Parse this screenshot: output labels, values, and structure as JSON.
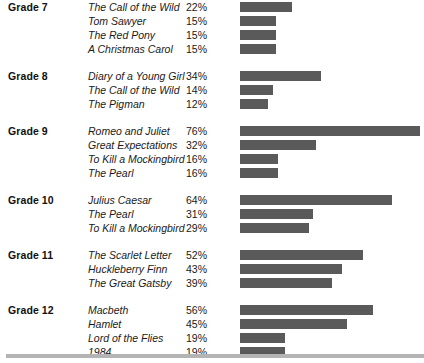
{
  "chart_data": {
    "type": "bar",
    "title": "",
    "subtitle": "",
    "xlabel": "",
    "ylabel": "",
    "xlim": [
      0,
      76
    ],
    "grid": false,
    "legend_position": "none",
    "orientation": "horizontal",
    "bar_color": "#5a5a5a",
    "value_suffix": "%",
    "groups": [
      {
        "label": "Grade 7",
        "items": [
          {
            "title": "The Call of the Wild",
            "value": 22,
            "value_label": "22%"
          },
          {
            "title": "Tom Sawyer",
            "value": 15,
            "value_label": "15%"
          },
          {
            "title": "The Red Pony",
            "value": 15,
            "value_label": "15%"
          },
          {
            "title": "A Christmas Carol",
            "value": 15,
            "value_label": "15%"
          }
        ]
      },
      {
        "label": "Grade 8",
        "items": [
          {
            "title": "Diary of a Young Girl",
            "value": 34,
            "value_label": "34%"
          },
          {
            "title": "The Call of the Wild",
            "value": 14,
            "value_label": "14%"
          },
          {
            "title": "The Pigman",
            "value": 12,
            "value_label": "12%"
          }
        ]
      },
      {
        "label": "Grade 9",
        "items": [
          {
            "title": "Romeo and Juliet",
            "value": 76,
            "value_label": "76%"
          },
          {
            "title": "Great Expectations",
            "value": 32,
            "value_label": "32%"
          },
          {
            "title": "To Kill a Mockingbird",
            "value": 16,
            "value_label": "16%"
          },
          {
            "title": "The Pearl",
            "value": 16,
            "value_label": "16%"
          }
        ]
      },
      {
        "label": "Grade 10",
        "items": [
          {
            "title": "Julius Caesar",
            "value": 64,
            "value_label": "64%"
          },
          {
            "title": "The Pearl",
            "value": 31,
            "value_label": "31%"
          },
          {
            "title": "To Kill a Mockingbird",
            "value": 29,
            "value_label": "29%"
          }
        ]
      },
      {
        "label": "Grade 11",
        "items": [
          {
            "title": "The Scarlet Letter",
            "value": 52,
            "value_label": "52%"
          },
          {
            "title": "Huckleberry Finn",
            "value": 43,
            "value_label": "43%"
          },
          {
            "title": "The Great Gatsby",
            "value": 39,
            "value_label": "39%"
          }
        ]
      },
      {
        "label": "Grade 12",
        "items": [
          {
            "title": "Macbeth",
            "value": 56,
            "value_label": "56%"
          },
          {
            "title": "Hamlet",
            "value": 45,
            "value_label": "45%"
          },
          {
            "title": "Lord of the Flies",
            "value": 19,
            "value_label": "19%"
          },
          {
            "title": "1984",
            "value": 19,
            "value_label": "19%"
          }
        ]
      }
    ]
  }
}
